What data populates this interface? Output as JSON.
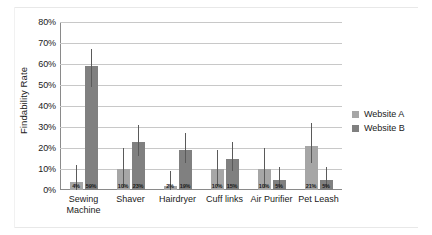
{
  "chart_data": {
    "type": "bar",
    "title": "",
    "subtitle": "",
    "xlabel": "",
    "ylabel": "Findability Rate",
    "ylim": [
      0,
      80
    ],
    "ytick_values": [
      0,
      10,
      20,
      30,
      40,
      50,
      60,
      70,
      80
    ],
    "ytick_labels": [
      "0%",
      "10%",
      "20%",
      "30%",
      "40%",
      "50%",
      "60%",
      "70%",
      "80%"
    ],
    "grid": true,
    "legend_position": "right",
    "categories": [
      "Sewing\nMachine",
      "Shaver",
      "Hairdryer",
      "Cuff links",
      "Air Purifier",
      "Pet Leash"
    ],
    "series": [
      {
        "name": "Website A",
        "color": "#a6a6a6",
        "values": [
          4,
          10,
          2,
          10,
          10,
          21
        ],
        "value_labels": [
          "4%",
          "10%",
          "2%",
          "10%",
          "10%",
          "21%"
        ],
        "error_low": [
          0,
          1,
          0,
          2,
          1,
          13
        ],
        "error_high": [
          12,
          20,
          9,
          19,
          20,
          32
        ]
      },
      {
        "name": "Website B",
        "color": "#808080",
        "values": [
          59,
          23,
          19,
          15,
          5,
          5
        ],
        "value_labels": [
          "59%",
          "23%",
          "19%",
          "15%",
          "5%",
          "5%"
        ],
        "error_low": [
          49,
          16,
          13,
          9,
          1,
          1
        ],
        "error_high": [
          67,
          31,
          27,
          23,
          11,
          11
        ]
      }
    ]
  },
  "legend": {
    "items": [
      {
        "label": "Website A",
        "color": "#a6a6a6"
      },
      {
        "label": "Website B",
        "color": "#808080"
      }
    ]
  }
}
